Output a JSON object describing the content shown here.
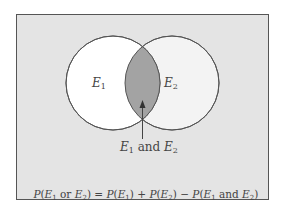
{
  "diagram": {
    "type": "venn",
    "sets": [
      {
        "label_var": "E",
        "label_sub": "1",
        "fill": "#ffffff"
      },
      {
        "label_var": "E",
        "label_sub": "2",
        "fill": "#f3f3f3"
      }
    ],
    "intersection": {
      "fill": "#a3a3a3",
      "label": {
        "v1": "E",
        "s1": "1",
        "conj": " and ",
        "v2": "E",
        "s2": "2"
      }
    },
    "background": "#e4e4e4",
    "border": "#555555",
    "formula": {
      "lhs_p": "P(",
      "lhs_v1": "E",
      "lhs_s1": "1",
      "lhs_or": " or ",
      "lhs_v2": "E",
      "lhs_s2": "2",
      "lhs_close": ")",
      "eq": " = ",
      "t1_p": "P(",
      "t1_v": "E",
      "t1_s": "1",
      "t1_close": ")",
      "plus": " + ",
      "t2_p": "P(",
      "t2_v": "E",
      "t2_s": "2",
      "t2_close": ")",
      "minus": " − ",
      "t3_p": "P(",
      "t3_v1": "E",
      "t3_s1": "1",
      "t3_and": " and ",
      "t3_v2": "E",
      "t3_s2": "2",
      "t3_close": ")"
    }
  }
}
